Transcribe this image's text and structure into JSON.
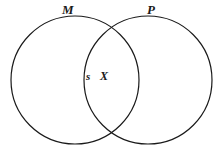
{
  "diagram": {
    "type": "venn-two-set",
    "title": "",
    "stroke_color": "#1a1a1a",
    "fill_color": "none",
    "background_color": "#ffffff",
    "stroke_width": 1.2,
    "sets": [
      {
        "id": "m",
        "label": "M",
        "center_x": 75,
        "center_y": 80,
        "radius": 64
      },
      {
        "id": "p",
        "label": "P",
        "center_x": 148,
        "center_y": 80,
        "radius": 64
      }
    ],
    "points": [
      {
        "id": "s",
        "label": "s",
        "region": "intersection-left-boundary",
        "x": 89,
        "y": 77
      },
      {
        "id": "x",
        "label": "X",
        "region": "intersection",
        "x": 105,
        "y": 77
      }
    ]
  }
}
